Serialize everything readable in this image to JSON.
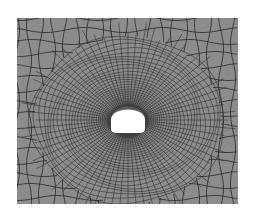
{
  "figure": {
    "canvas": {
      "width": 253,
      "height": 219,
      "background": "#ffffff"
    },
    "mesh": {
      "bounds": {
        "x": 17,
        "y": 18,
        "width": 221,
        "height": 186
      },
      "fill_color": "#8c8c8c",
      "line_color": "#2b2b2b",
      "element_type": "quadrilateral",
      "radial_lines": 72,
      "rings": 34,
      "coarse_grid_spacing": 12
    },
    "opening": {
      "shape": "horseshoe",
      "center_x": 128,
      "center_y": 120,
      "width": 34,
      "height": 26,
      "fill_color": "#ffffff"
    }
  }
}
